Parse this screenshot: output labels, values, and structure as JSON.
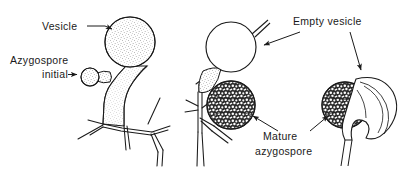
{
  "figure": {
    "background_color": "#ffffff",
    "ink_color": "#1a1a1a",
    "width": 409,
    "height": 174
  },
  "labels": [
    {
      "id": "vesicle",
      "text": "Vesicle",
      "x": 42,
      "y": 30
    },
    {
      "id": "azygospore_initial_1",
      "text": "Azygospore",
      "x": 10,
      "y": 64
    },
    {
      "id": "azygospore_initial_2",
      "text": "initial",
      "x": 42,
      "y": 78
    },
    {
      "id": "empty_vesicle",
      "text": "Empty vesicle",
      "x": 293,
      "y": 25
    },
    {
      "id": "mature_azygospore_1",
      "text": "Mature",
      "x": 263,
      "y": 140
    },
    {
      "id": "mature_azygospore_2",
      "text": "azygospore",
      "x": 255,
      "y": 155
    }
  ],
  "structures": [
    {
      "id": "left-vesicle",
      "name": "Vesicle",
      "fill": "stipple-fine",
      "cx": 130,
      "cy": 42,
      "r": 25
    },
    {
      "id": "azygospore-initial",
      "name": "Azygospore initial",
      "fill": "stipple-fine",
      "cx": 90,
      "cy": 77,
      "r": 9
    },
    {
      "id": "empty-vesicle-round",
      "name": "Empty vesicle",
      "fill": "none",
      "cx": 231,
      "cy": 47,
      "r": 25
    },
    {
      "id": "mature-azygospore-1",
      "name": "Mature azygospore",
      "fill": "stipple-coarse",
      "cx": 231,
      "cy": 105,
      "r": 24
    },
    {
      "id": "mature-azygospore-2",
      "name": "Mature azygospore",
      "fill": "stipple-coarse",
      "cx": 345,
      "cy": 105,
      "r": 23
    },
    {
      "id": "empty-vesicle-collapsed",
      "name": "Collapsed empty vesicle",
      "fill": "none",
      "cx": 378,
      "cy": 103,
      "r": 28
    }
  ],
  "leaders": [
    {
      "id": "leader-vesicle",
      "from_label": "Vesicle",
      "to_structure": "left-vesicle"
    },
    {
      "id": "leader-azygospore-initial",
      "from_label": "initial",
      "to_structure": "azygospore-initial"
    },
    {
      "id": "leader-empty-vesicle-a",
      "from_label": "Empty vesicle",
      "to_structure": "empty-vesicle-round"
    },
    {
      "id": "leader-empty-vesicle-b",
      "from_label": "Empty vesicle",
      "to_structure": "empty-vesicle-collapsed"
    },
    {
      "id": "leader-mature-a",
      "from_label": "Mature azygospore",
      "to_structure": "mature-azygospore-1"
    },
    {
      "id": "leader-mature-b",
      "from_label": "Mature azygospore",
      "to_structure": "mature-azygospore-2"
    }
  ]
}
